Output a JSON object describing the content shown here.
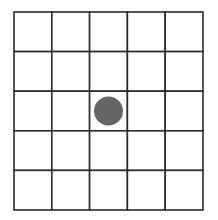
{
  "board": {
    "rows": 5,
    "cols": 5,
    "line_color": "#2b2b2b",
    "background": "#ffffff",
    "pieces": [
      {
        "row": 2,
        "col": 2,
        "type": "stone",
        "color": "#666666"
      }
    ]
  }
}
